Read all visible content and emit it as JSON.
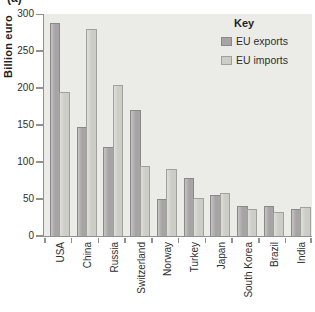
{
  "figure": {
    "corner_label": "(a)"
  },
  "chart_data": {
    "type": "bar",
    "title": "",
    "ylabel": "Billion euro",
    "xlabel": "",
    "categories": [
      "USA",
      "China",
      "Russia",
      "Switzerland",
      "Norway",
      "Turkey",
      "Japan",
      "South Korea",
      "Brazil",
      "India"
    ],
    "series": [
      {
        "name": "EU exports",
        "color": "#a7a4a5",
        "edge_color": "#8b888a",
        "values": [
          288,
          148,
          120,
          170,
          50,
          79,
          55,
          40,
          41,
          36
        ]
      },
      {
        "name": "EU imports",
        "color": "#cccdc7",
        "edge_color": "#9fa19a",
        "values": [
          195,
          280,
          205,
          95,
          91,
          51,
          58,
          36,
          33,
          39
        ]
      }
    ],
    "ylim": [
      0,
      300
    ],
    "yticks": [
      0,
      50,
      100,
      150,
      200,
      250,
      300
    ],
    "legend_title": "Key",
    "legend_position": "top-right-inside",
    "grid": false,
    "plot_bg": "#ebece8",
    "axis_color": "#8f928f"
  }
}
